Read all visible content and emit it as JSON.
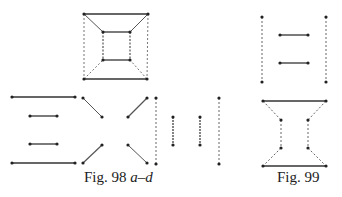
{
  "figures": {
    "fig98": {
      "caption_prefix": "Fig. 98 ",
      "caption_suffix": "a–d"
    },
    "fig99": {
      "caption": "Fig. 99"
    }
  },
  "style": {
    "line_color": "#333333",
    "node_color": "#222222",
    "background": "#ffffff"
  }
}
